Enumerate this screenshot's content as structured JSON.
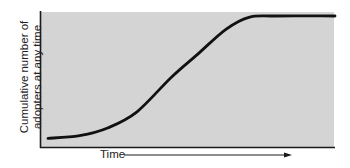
{
  "chart_data": {
    "type": "line",
    "title": "",
    "xlabel": "Time",
    "ylabel": "Cumulative number of adopters at any time",
    "ylabel_lines": [
      "Cumulative number of",
      "adopters at any time"
    ],
    "x_axis_arrow": true,
    "grid": false,
    "legend": null,
    "background_color": "#d4d4d4",
    "line_color": "#111111",
    "series": [
      {
        "name": "Cumulative adopters",
        "x": [
          0,
          0.11,
          0.21,
          0.31,
          0.43,
          0.52,
          0.62,
          0.7,
          0.79,
          1.0
        ],
        "values": [
          0.05,
          0.07,
          0.13,
          0.25,
          0.51,
          0.68,
          0.87,
          0.96,
          0.97,
          0.97
        ]
      }
    ],
    "xlim": [
      0,
      1
    ],
    "ylim": [
      0,
      1
    ]
  }
}
